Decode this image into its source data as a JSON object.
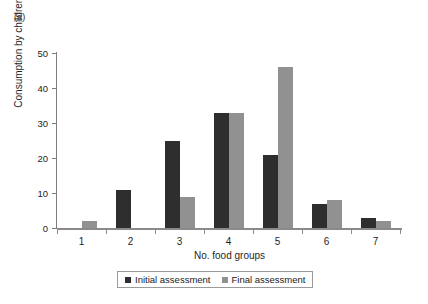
{
  "panel": {
    "label": "(a)"
  },
  "chart_data": {
    "type": "bar",
    "title": "",
    "subtitle": "",
    "xlabel": "No. food groups",
    "ylabel": "Consumption by children (%)",
    "categories": [
      "1",
      "2",
      "3",
      "4",
      "5",
      "6",
      "7"
    ],
    "series": [
      {
        "name": "Initial assessment",
        "color": "#2e2e2e",
        "values": [
          0,
          11,
          25,
          33,
          21,
          7,
          3
        ]
      },
      {
        "name": "Final assessment",
        "color": "#919191",
        "values": [
          2,
          0,
          9,
          33,
          46,
          8,
          2
        ]
      }
    ],
    "ylim": [
      0,
      50
    ],
    "yticks": [
      0,
      10,
      20,
      30,
      40,
      50
    ],
    "ytick_labels": [
      "0",
      "10",
      "20",
      "30",
      "40",
      "50"
    ],
    "grid": false,
    "legend_position": "bottom",
    "legend_entries": [
      "Initial assessment",
      "Final assessment"
    ]
  },
  "colors": {
    "initial": "#2e2e2e",
    "final": "#919191",
    "axis": "#8a8a8a",
    "text": "#1a1a1a",
    "background": "#ffffff"
  }
}
